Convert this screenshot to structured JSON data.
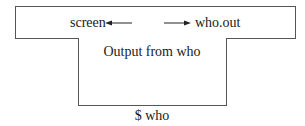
{
  "diagram": {
    "top_box": {
      "left_target": "screen",
      "right_target": "who.out"
    },
    "inner_box": {
      "label": "Output from who"
    },
    "command": "$ who",
    "arrows": [
      {
        "direction": "left",
        "points_to": "screen"
      },
      {
        "direction": "right",
        "points_to": "who.out"
      }
    ]
  }
}
